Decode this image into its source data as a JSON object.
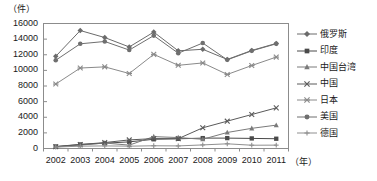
{
  "chart_data": {
    "type": "line",
    "title": "",
    "xlabel": "年",
    "ylabel": "",
    "unit_label": "（件）",
    "xaxis_unit": "（年）",
    "grid": false,
    "legend_position": "right",
    "categories": [
      "2002",
      "2003",
      "2004",
      "2005",
      "2006",
      "2007",
      "2008",
      "2009",
      "2010",
      "2011"
    ],
    "ylim": [
      0,
      16000
    ],
    "yticks": [
      16000,
      14000,
      12000,
      10000,
      8000,
      6000,
      4000,
      2000,
      0
    ],
    "series": [
      {
        "name": "俄罗斯",
        "marker": "diamond",
        "color": "#6b6b6b",
        "values": [
          11800,
          15100,
          14200,
          13000,
          14900,
          12500,
          12700,
          11400,
          12550,
          13450
        ]
      },
      {
        "name": "印度",
        "marker": "square",
        "color": "#4a4a4a",
        "values": [
          260,
          520,
          680,
          850,
          1180,
          1240,
          1330,
          1330,
          1290,
          1250
        ]
      },
      {
        "name": "中国台湾",
        "marker": "triangle",
        "color": "#7a7a7a",
        "values": [
          200,
          430,
          700,
          430,
          1520,
          1400,
          1180,
          2050,
          2580,
          2990
        ]
      },
      {
        "name": "中国",
        "marker": "cross",
        "color": "#5a5a5a",
        "values": [
          230,
          500,
          760,
          1100,
          1270,
          1260,
          2650,
          3500,
          4350,
          5200
        ]
      },
      {
        "name": "日本",
        "marker": "asterisk",
        "color": "#8a8a8a",
        "values": [
          8250,
          10300,
          10450,
          9600,
          12050,
          10650,
          10950,
          9480,
          10620,
          11700
        ]
      },
      {
        "name": "美国",
        "marker": "circle",
        "color": "#6f6f6f",
        "values": [
          11300,
          13400,
          13700,
          12600,
          14450,
          12200,
          13500,
          11350,
          12500,
          13400
        ]
      },
      {
        "name": "德国",
        "marker": "plus",
        "color": "#8f8f8f",
        "values": [
          180,
          300,
          330,
          300,
          350,
          330,
          460,
          600,
          420,
          430
        ]
      }
    ]
  }
}
